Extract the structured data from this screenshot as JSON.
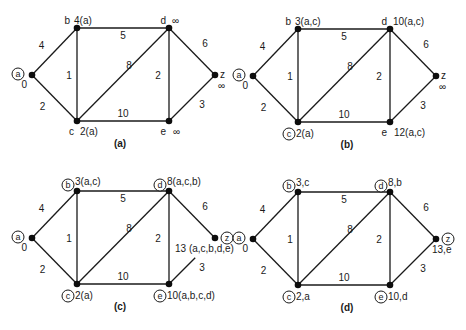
{
  "figure": {
    "edges": [
      {
        "from": "a",
        "to": "b",
        "weight": "4"
      },
      {
        "from": "a",
        "to": "c",
        "weight": "2"
      },
      {
        "from": "b",
        "to": "c",
        "weight": "1"
      },
      {
        "from": "b",
        "to": "d",
        "weight": "5"
      },
      {
        "from": "c",
        "to": "d",
        "weight": "8"
      },
      {
        "from": "c",
        "to": "e",
        "weight": "10"
      },
      {
        "from": "d",
        "to": "e",
        "weight": "2"
      },
      {
        "from": "d",
        "to": "z",
        "weight": "6"
      },
      {
        "from": "e",
        "to": "z",
        "weight": "3"
      }
    ],
    "panels": [
      {
        "caption": "(a)",
        "origin": [
          0,
          0
        ],
        "nodes": {
          "a": {
            "name": "a",
            "label": "0",
            "circled": true
          },
          "b": {
            "name": "b",
            "label": "4(a)",
            "circled": false
          },
          "c": {
            "name": "c",
            "label": "2(a)",
            "circled": false
          },
          "d": {
            "name": "d",
            "label": "∞",
            "circled": false
          },
          "e": {
            "name": "e",
            "label": "∞",
            "circled": false
          },
          "z": {
            "name": "z",
            "label": "∞",
            "circled": false
          }
        }
      },
      {
        "caption": "(b)",
        "origin": [
          221,
          1
        ],
        "nodes": {
          "a": {
            "name": "a",
            "label": "0",
            "circled": true
          },
          "b": {
            "name": "b",
            "label": "3(a,c)",
            "circled": false
          },
          "c": {
            "name": "c",
            "label": "2(a)",
            "circled": true
          },
          "d": {
            "name": "d",
            "label": "10(a,c)",
            "circled": false
          },
          "e": {
            "name": "e",
            "label": "12(a,c)",
            "circled": false
          },
          "z": {
            "name": "z",
            "label": "∞",
            "circled": false
          }
        }
      },
      {
        "caption": "(c)",
        "origin": [
          0,
          163
        ],
        "nodes": {
          "a": {
            "name": "a",
            "label": "0",
            "circled": true
          },
          "b": {
            "name": "b",
            "label": "3(a,c)",
            "circled": true
          },
          "c": {
            "name": "c",
            "label": "2(a)",
            "circled": true
          },
          "d": {
            "name": "d",
            "label": "8(a,c,b)",
            "circled": true
          },
          "e": {
            "name": "e",
            "label": "10(a,b,c,d)",
            "circled": true
          },
          "z": {
            "name": "z",
            "label": "13 (a,c,b,d,e)",
            "circled": true
          }
        }
      },
      {
        "caption": "(d)",
        "origin": [
          221,
          164
        ],
        "nodes": {
          "a": {
            "name": "a",
            "label": "0",
            "circled": true
          },
          "b": {
            "name": "b",
            "label": "3,c",
            "circled": true
          },
          "c": {
            "name": "c",
            "label": "2,a",
            "circled": true
          },
          "d": {
            "name": "d",
            "label": "8,b",
            "circled": true
          },
          "e": {
            "name": "e",
            "label": "10,d",
            "circled": true
          },
          "z": {
            "name": "z",
            "label": "13,e",
            "circled": true
          }
        }
      }
    ]
  }
}
